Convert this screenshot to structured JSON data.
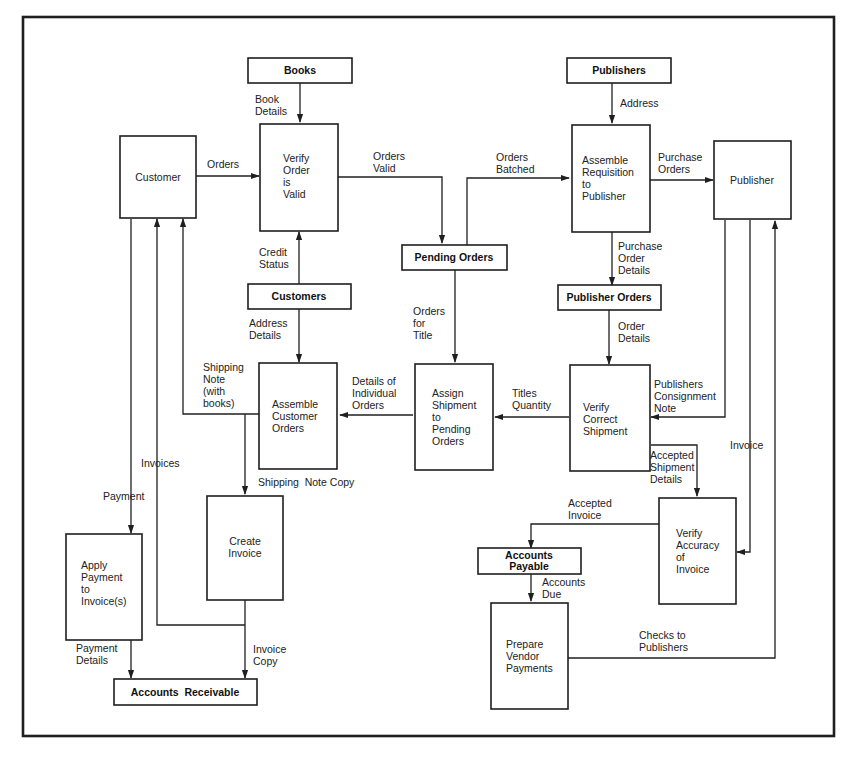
{
  "processes": {
    "customer": {
      "lines": [
        "Customer"
      ]
    },
    "verify_order": {
      "lines": [
        "Verify",
        "Order",
        "is",
        "Valid"
      ]
    },
    "assemble_requisition": {
      "lines": [
        "Assemble",
        "Requisition",
        "to",
        "Publisher"
      ]
    },
    "publisher": {
      "lines": [
        "Publisher"
      ]
    },
    "assemble_customer_orders": {
      "lines": [
        "Assemble",
        "Customer",
        "Orders"
      ]
    },
    "assign_shipment": {
      "lines": [
        "Assign",
        "Shipment",
        "to",
        "Pending",
        "Orders"
      ]
    },
    "verify_shipment": {
      "lines": [
        "Verify",
        "Correct",
        "Shipment"
      ]
    },
    "create_invoice": {
      "lines": [
        "Create",
        "Invoice"
      ]
    },
    "apply_payment": {
      "lines": [
        "Apply",
        "Payment",
        "to",
        "Invoice(s)"
      ]
    },
    "verify_invoice": {
      "lines": [
        "Verify",
        "Accuracy",
        "of",
        "Invoice"
      ]
    },
    "prepare_payments": {
      "lines": [
        "Prepare",
        "Vendor",
        "Payments"
      ]
    }
  },
  "stores": {
    "books": {
      "lines": [
        "Books"
      ]
    },
    "publishers": {
      "lines": [
        "Publishers"
      ]
    },
    "pending_orders": {
      "lines": [
        "Pending Orders"
      ]
    },
    "customers": {
      "lines": [
        "Customers"
      ]
    },
    "publisher_orders": {
      "lines": [
        "Publisher Orders"
      ]
    },
    "accounts_payable": {
      "lines": [
        "Accounts",
        "Payable"
      ]
    },
    "accounts_receivable": {
      "lines": [
        "Accounts  Receivable"
      ]
    }
  },
  "flows": {
    "book_details": {
      "lines": [
        "Book",
        "Details"
      ]
    },
    "address": {
      "lines": [
        "Address"
      ]
    },
    "orders": {
      "lines": [
        "Orders"
      ]
    },
    "orders_valid": {
      "lines": [
        "Orders",
        "Valid"
      ]
    },
    "orders_batched": {
      "lines": [
        "Orders",
        "Batched"
      ]
    },
    "purchase_orders": {
      "lines": [
        "Purchase",
        "Orders"
      ]
    },
    "credit_status": {
      "lines": [
        "Credit",
        "Status"
      ]
    },
    "purchase_order_details": {
      "lines": [
        "Purchase",
        "Order",
        "Details"
      ]
    },
    "address_details": {
      "lines": [
        "Address",
        "Details"
      ]
    },
    "orders_for_title": {
      "lines": [
        "Orders",
        "for",
        "Title"
      ]
    },
    "order_details": {
      "lines": [
        "Order",
        "Details"
      ]
    },
    "shipping_note": {
      "lines": [
        "Shipping",
        "Note",
        "(with",
        "books)"
      ]
    },
    "details_individual_orders": {
      "lines": [
        "Details of",
        "Individual",
        "Orders"
      ]
    },
    "titles_quantity": {
      "lines": [
        "Titles",
        "Quantity"
      ]
    },
    "consignment_note": {
      "lines": [
        "Publishers",
        "Consignment",
        "Note"
      ]
    },
    "invoices": {
      "lines": [
        "Invoices"
      ]
    },
    "invoice": {
      "lines": [
        "Invoice"
      ]
    },
    "shipping_note_copy": {
      "lines": [
        "Shipping  Note Copy"
      ]
    },
    "accepted_shipment": {
      "lines": [
        "Accepted",
        "Shipment",
        "Details"
      ]
    },
    "payment": {
      "lines": [
        "Payment"
      ]
    },
    "accepted_invoice": {
      "lines": [
        "Accepted",
        "Invoice"
      ]
    },
    "accounts_due": {
      "lines": [
        "Accounts",
        "Due"
      ]
    },
    "checks_to_publishers": {
      "lines": [
        "Checks to",
        "Publishers"
      ]
    },
    "payment_details": {
      "lines": [
        "Payment",
        "Details"
      ]
    },
    "invoice_copy": {
      "lines": [
        "Invoice",
        "Copy"
      ]
    }
  },
  "colors": {
    "ink": "#1f1f1f",
    "background": "#ffffff"
  }
}
